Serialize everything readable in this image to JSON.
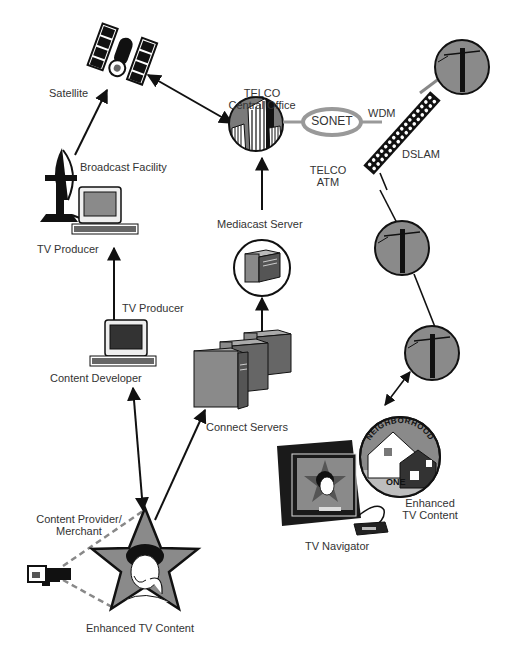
{
  "labels": {
    "satellite": "Satellite",
    "telco_central_office_1": "TELCO",
    "telco_central_office_2": "Central Office",
    "sonet": "SONET",
    "telco_atm_1": "TELCO",
    "telco_atm_2": "ATM",
    "wdm": "WDM",
    "dslam": "DSLAM",
    "broadcast_facility": "Broadcast Facility",
    "tv_producer_top": "TV Producer",
    "mediacast_server": "Mediacast Server",
    "tv_producer_mid": "TV Producer",
    "content_developer": "Content Developer",
    "connect_servers": "Connect Servers",
    "neighborhood_top": "NEIGHBORHOOD",
    "neighborhood_bottom": "ONE",
    "enhanced_tv_content_right_1": "Enhanced",
    "enhanced_tv_content_right_2": "TV Content",
    "tv_navigator": "TV Navigator",
    "content_provider_1": "Content Provider/",
    "content_provider_2": "Merchant",
    "enhanced_tv_content_bottom": "Enhanced TV Content"
  },
  "colors": {
    "ink": "#111111",
    "gray_fill": "#8a8a8a",
    "light_gray": "#bdbdbd",
    "text": "#333333"
  }
}
